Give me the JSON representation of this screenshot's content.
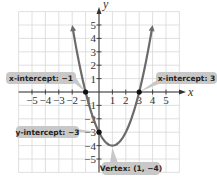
{
  "chart_data": {
    "type": "line",
    "title": "",
    "function": "y = x^2 - 2x - 3",
    "xlabel": "x",
    "ylabel": "y",
    "xlim": [
      -6,
      6
    ],
    "ylim": [
      -6,
      6
    ],
    "grid": true,
    "x_ticks": [
      "-5",
      "-4",
      "-3",
      "-2",
      "-1",
      "1",
      "2",
      "3",
      "4",
      "5"
    ],
    "y_ticks": [
      "5",
      "4",
      "3",
      "2",
      "1",
      "-1",
      "-2",
      "-3",
      "-4",
      "-5"
    ],
    "series": [
      {
        "name": "parabola",
        "color": "#6b6b6b",
        "x": [
          -1.9,
          -1.5,
          -1,
          -0.5,
          0,
          0.5,
          1,
          1.5,
          2,
          2.5,
          3,
          3.5,
          3.9
        ],
        "y": [
          4.41,
          2.25,
          0,
          -1.75,
          -3,
          -3.75,
          -4,
          -3.75,
          -3,
          -1.75,
          0,
          2.25,
          4.41
        ]
      }
    ],
    "points": [
      {
        "x": -1,
        "y": 0,
        "label": "x-intercept: −1"
      },
      {
        "x": 3,
        "y": 0,
        "label": "x-intercept: 3"
      },
      {
        "x": 0,
        "y": -3,
        "label": "y-intercept: −3"
      },
      {
        "x": 1,
        "y": -4,
        "label": "Vertex: (1, −4)"
      }
    ]
  },
  "axes": {
    "x_label": "x",
    "y_label": "y"
  },
  "callouts": {
    "x_intercept_left": "x-intercept: −1",
    "x_intercept_right": "x-intercept: 3",
    "y_intercept": "y-intercept: −3",
    "vertex": "Vertex: (1, −4)"
  },
  "colors": {
    "curve": "#6b6b6b",
    "grid": "#d8d8d8",
    "axis": "#333333",
    "callout_bg": "#c8c8c8",
    "point": "#111111"
  }
}
